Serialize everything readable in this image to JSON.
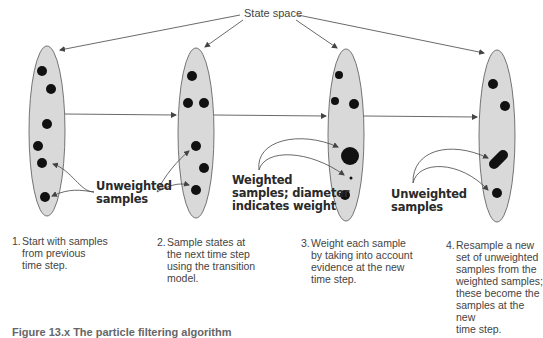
{
  "title_label": "State space",
  "colors": {
    "ellipse_fill": "#d9d9d9",
    "ellipse_stroke": "#555555",
    "sample_fill": "#111111",
    "arrow": "#444444"
  },
  "annotations": {
    "unweighted_left": [
      "Unweighted",
      "samples"
    ],
    "weighted_middle": [
      "Weighted",
      "samples; diameter",
      "indicates weight"
    ],
    "unweighted_right": [
      "Unweighted",
      "samples"
    ]
  },
  "steps": [
    {
      "number": "1.",
      "text": "Start with samples\nfrom previous\ntime step."
    },
    {
      "number": "2.",
      "text": "Sample states at\nthe next time step\nusing the transition\nmodel."
    },
    {
      "number": "3.",
      "text": "Weight each sample\nby taking into account\nevidence at the new\ntime step."
    },
    {
      "number": "4.",
      "text": "Resample a new\nset of unweighted\nsamples from the\nweighted samples;\nthese become the\nsamples at the new\ntime step."
    }
  ],
  "caption": "Figure 13.x  The particle filtering algorithm"
}
